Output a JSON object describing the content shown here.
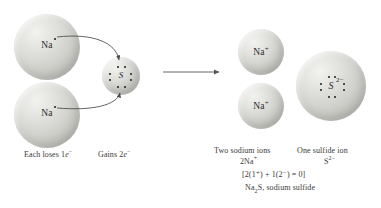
{
  "figure": {
    "type": "chemistry-reaction-diagram",
    "background_color": "#ffffff",
    "sphere_color": "#d2d2ce",
    "dot_color": "#1d1d1b"
  },
  "reactants": {
    "sodium_top": {
      "label": "Na",
      "charge": "",
      "valence_dots": 1
    },
    "sodium_bottom": {
      "label": "Na",
      "charge": "",
      "valence_dots": 1
    },
    "sulfur": {
      "label": "S",
      "charge": "",
      "valence_dots": 6
    }
  },
  "products": {
    "sodium_ion_top": {
      "label": "Na",
      "charge": "+"
    },
    "sodium_ion_bottom": {
      "label": "Na",
      "charge": "+"
    },
    "sulfide_ion": {
      "label": "S",
      "charge": "2−",
      "valence_dots": 8
    }
  },
  "captions": {
    "each_loses": "Each loses 1",
    "each_loses_electron": "e",
    "each_loses_super": "−",
    "gains": "Gains 2",
    "gains_electron": "e",
    "gains_super": "−",
    "two_sodium_ions": "Two sodium ions",
    "two_sodium_formula": "2Na",
    "two_sodium_formula_super": "+",
    "one_sulfide_ion": "One sulfide ion",
    "one_sulfide_formula": "S",
    "one_sulfide_formula_super": "2−",
    "charge_balance": "[2(1⁺) + 1(2⁻) = 0]",
    "compound_prefix": "Na",
    "compound_sub": "2",
    "compound_suffix": "S, sodium sulfide"
  },
  "arrows": {
    "reaction_arrow": "reaction-arrow-right",
    "electron_transfer_top": "curved-electron-transfer-arrow",
    "electron_transfer_bottom": "curved-electron-transfer-arrow"
  }
}
